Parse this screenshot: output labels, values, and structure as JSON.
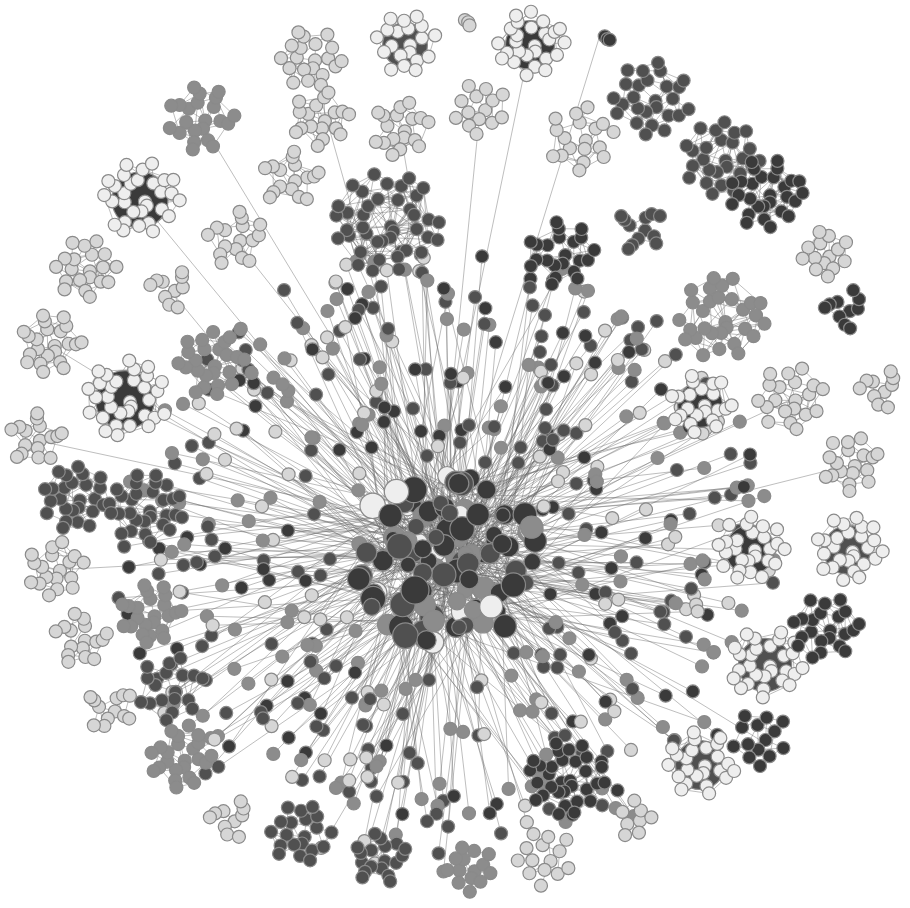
{
  "diagram": {
    "type": "network-graph",
    "background": "#ffffff",
    "palette": {
      "light": "#d6d6d6",
      "mid": "#8c8c8c",
      "dark": "#505050",
      "darker": "#3a3a3a",
      "white": "#eeeeee",
      "edge": "#6a6a6a"
    },
    "hub": {
      "cx": 445,
      "cy": 560,
      "r_core": 95,
      "spokes": 520,
      "spoke_r_min": 110,
      "spoke_r_max": 330
    },
    "clusters": [
      {
        "cx": 140,
        "cy": 200,
        "r": 40,
        "n": 30,
        "tone": "white",
        "core": "darker"
      },
      {
        "cx": 200,
        "cy": 120,
        "r": 35,
        "n": 22,
        "tone": "mid"
      },
      {
        "cx": 310,
        "cy": 60,
        "r": 32,
        "n": 20,
        "tone": "light"
      },
      {
        "cx": 405,
        "cy": 45,
        "r": 32,
        "n": 20,
        "tone": "white",
        "core": "dark"
      },
      {
        "cx": 530,
        "cy": 45,
        "r": 35,
        "n": 26,
        "tone": "white",
        "core": "darker"
      },
      {
        "cx": 320,
        "cy": 120,
        "r": 30,
        "n": 18,
        "tone": "light"
      },
      {
        "cx": 400,
        "cy": 130,
        "r": 30,
        "n": 18,
        "tone": "light"
      },
      {
        "cx": 480,
        "cy": 110,
        "r": 28,
        "n": 14,
        "tone": "light"
      },
      {
        "cx": 580,
        "cy": 140,
        "r": 35,
        "n": 18,
        "tone": "light"
      },
      {
        "cx": 650,
        "cy": 100,
        "r": 40,
        "n": 26,
        "tone": "dark"
      },
      {
        "cx": 720,
        "cy": 160,
        "r": 40,
        "n": 26,
        "tone": "dark"
      },
      {
        "cx": 765,
        "cy": 195,
        "r": 38,
        "n": 28,
        "tone": "darker"
      },
      {
        "cx": 385,
        "cy": 225,
        "r": 55,
        "n": 40,
        "tone": "dark"
      },
      {
        "cx": 560,
        "cy": 255,
        "r": 35,
        "n": 22,
        "tone": "darker"
      },
      {
        "cx": 290,
        "cy": 180,
        "r": 30,
        "n": 16,
        "tone": "light"
      },
      {
        "cx": 235,
        "cy": 240,
        "r": 30,
        "n": 16,
        "tone": "light"
      },
      {
        "cx": 85,
        "cy": 270,
        "r": 32,
        "n": 20,
        "tone": "light"
      },
      {
        "cx": 50,
        "cy": 345,
        "r": 32,
        "n": 22,
        "tone": "light"
      },
      {
        "cx": 125,
        "cy": 400,
        "r": 42,
        "n": 32,
        "tone": "white",
        "core": "darker"
      },
      {
        "cx": 210,
        "cy": 365,
        "r": 35,
        "n": 24,
        "tone": "mid"
      },
      {
        "cx": 35,
        "cy": 440,
        "r": 28,
        "n": 16,
        "tone": "light"
      },
      {
        "cx": 75,
        "cy": 500,
        "r": 35,
        "n": 26,
        "tone": "dark"
      },
      {
        "cx": 145,
        "cy": 510,
        "r": 38,
        "n": 28,
        "tone": "dark"
      },
      {
        "cx": 55,
        "cy": 570,
        "r": 30,
        "n": 18,
        "tone": "light"
      },
      {
        "cx": 150,
        "cy": 615,
        "r": 32,
        "n": 22,
        "tone": "mid"
      },
      {
        "cx": 80,
        "cy": 640,
        "r": 28,
        "n": 16,
        "tone": "light"
      },
      {
        "cx": 170,
        "cy": 690,
        "r": 35,
        "n": 18,
        "tone": "dark"
      },
      {
        "cx": 110,
        "cy": 710,
        "r": 25,
        "n": 12,
        "tone": "light"
      },
      {
        "cx": 180,
        "cy": 760,
        "r": 32,
        "n": 22,
        "tone": "mid"
      },
      {
        "cx": 230,
        "cy": 820,
        "r": 22,
        "n": 10,
        "tone": "light"
      },
      {
        "cx": 300,
        "cy": 835,
        "r": 32,
        "n": 20,
        "tone": "dark"
      },
      {
        "cx": 380,
        "cy": 860,
        "r": 28,
        "n": 16,
        "tone": "dark"
      },
      {
        "cx": 470,
        "cy": 870,
        "r": 25,
        "n": 14,
        "tone": "mid"
      },
      {
        "cx": 545,
        "cy": 860,
        "r": 30,
        "n": 14,
        "tone": "light"
      },
      {
        "cx": 565,
        "cy": 780,
        "r": 40,
        "n": 30,
        "tone": "darker"
      },
      {
        "cx": 635,
        "cy": 820,
        "r": 20,
        "n": 8,
        "tone": "light"
      },
      {
        "cx": 700,
        "cy": 765,
        "r": 35,
        "n": 24,
        "tone": "white",
        "core": "dark"
      },
      {
        "cx": 760,
        "cy": 740,
        "r": 30,
        "n": 14,
        "tone": "darker"
      },
      {
        "cx": 765,
        "cy": 665,
        "r": 38,
        "n": 28,
        "tone": "white",
        "core": "dark"
      },
      {
        "cx": 825,
        "cy": 630,
        "r": 35,
        "n": 22,
        "tone": "darker"
      },
      {
        "cx": 750,
        "cy": 550,
        "r": 35,
        "n": 26,
        "tone": "white",
        "core": "darker"
      },
      {
        "cx": 848,
        "cy": 550,
        "r": 35,
        "n": 26,
        "tone": "white",
        "core": "dark"
      },
      {
        "cx": 850,
        "cy": 465,
        "r": 30,
        "n": 18,
        "tone": "light"
      },
      {
        "cx": 880,
        "cy": 390,
        "r": 22,
        "n": 10,
        "tone": "light"
      },
      {
        "cx": 845,
        "cy": 310,
        "r": 22,
        "n": 10,
        "tone": "darker"
      },
      {
        "cx": 825,
        "cy": 255,
        "r": 25,
        "n": 14,
        "tone": "light"
      },
      {
        "cx": 700,
        "cy": 405,
        "r": 32,
        "n": 22,
        "tone": "white",
        "core": "darker"
      },
      {
        "cx": 720,
        "cy": 320,
        "r": 45,
        "n": 30,
        "tone": "mid"
      },
      {
        "cx": 790,
        "cy": 400,
        "r": 35,
        "n": 20,
        "tone": "light"
      },
      {
        "cx": 640,
        "cy": 230,
        "r": 25,
        "n": 12,
        "tone": "dark"
      },
      {
        "cx": 170,
        "cy": 290,
        "r": 22,
        "n": 10,
        "tone": "light"
      },
      {
        "cx": 460,
        "cy": 20,
        "r": 12,
        "n": 3,
        "tone": "light"
      },
      {
        "cx": 600,
        "cy": 35,
        "r": 12,
        "n": 3,
        "tone": "darker"
      }
    ]
  }
}
